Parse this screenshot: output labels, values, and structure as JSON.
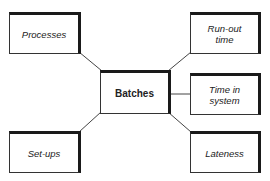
{
  "diagram": {
    "center": {
      "id": "batches",
      "label": "Batches"
    },
    "nodes": [
      {
        "id": "processes",
        "label": "Processes"
      },
      {
        "id": "run-out-time",
        "label": "Run-out\ntime"
      },
      {
        "id": "time-in-system",
        "label": "Time in\nsystem"
      },
      {
        "id": "set-ups",
        "label": "Set-ups"
      },
      {
        "id": "lateness",
        "label": "Lateness"
      }
    ],
    "edges": [
      {
        "from": "batches",
        "to": "processes"
      },
      {
        "from": "batches",
        "to": "run-out-time"
      },
      {
        "from": "batches",
        "to": "time-in-system"
      },
      {
        "from": "batches",
        "to": "set-ups"
      },
      {
        "from": "batches",
        "to": "lateness"
      }
    ],
    "colors": {
      "line": "#444444",
      "border": "#1a1a1a",
      "text": "#222222",
      "background": "#ffffff"
    }
  }
}
